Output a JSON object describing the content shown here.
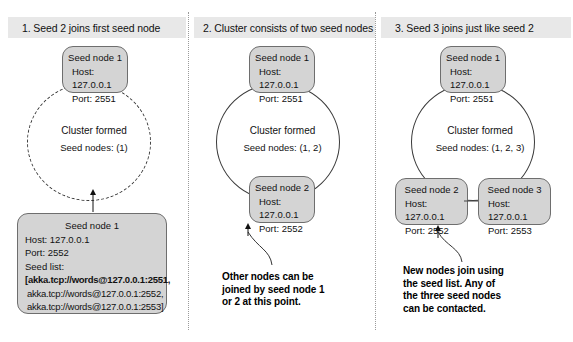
{
  "panels": [
    {
      "header": "1. Seed 2 joins first seed node",
      "top_node": {
        "title": "Seed node 1",
        "host": "Host: 127.0.0.1",
        "port": "Port: 2551"
      },
      "cluster": {
        "title": "Cluster formed",
        "seed_nodes": "Seed nodes: (1)"
      },
      "bottom_node": {
        "title": "Seed node 1",
        "host": "Host: 127.0.0.1",
        "port": "Port: 2552",
        "seed_list_label": "Seed list:",
        "seed_list": [
          "[akka.tcp://words@127.0.0.1:2551,",
          "akka.tcp://words@127.0.0.1:2552,",
          "akka.tcp://words@127.0.0.1:2553]"
        ]
      }
    },
    {
      "header": "2. Cluster consists of two seed nodes",
      "top_node": {
        "title": "Seed node 1",
        "host": "Host: 127.0.0.1",
        "port": "Port: 2551"
      },
      "cluster": {
        "title": "Cluster formed",
        "seed_nodes": "Seed nodes: (1, 2)"
      },
      "bottom_node": {
        "title": "Seed node 2",
        "host": "Host: 127.0.0.1",
        "port": "Port: 2552"
      },
      "callout": "Other nodes can be\njoined by seed node 1\nor 2 at this point."
    },
    {
      "header": "3. Seed 3 joins just like seed 2",
      "top_node": {
        "title": "Seed node 1",
        "host": "Host: 127.0.0.1",
        "port": "Port: 2551"
      },
      "cluster": {
        "title": "Cluster formed",
        "seed_nodes": "Seed nodes: (1, 2, 3)"
      },
      "bottom_node_left": {
        "title": "Seed node 2",
        "host": "Host: 127.0.0.1",
        "port": "Port: 2552"
      },
      "bottom_node_right": {
        "title": "Seed node 3",
        "host": "Host: 127.0.0.1",
        "port": "Port: 2553"
      },
      "callout": "New nodes join using\nthe seed list. Any of\nthe three seed nodes\ncan be contacted."
    }
  ],
  "colors": {
    "node_fill": "#d4d4d4",
    "node_border": "#6e6e6e",
    "header_band": "#e8e8e8",
    "divider": "#9a9a9a",
    "text": "#111111"
  }
}
